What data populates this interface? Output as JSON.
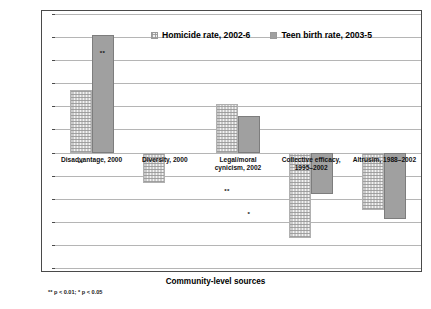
{
  "chart_data": {
    "type": "bar",
    "title": "",
    "xlabel": "Community-level sources",
    "ylabel": "Standardized coefficients",
    "ylim": [
      -0.5,
      0.6
    ],
    "ytick_values": [
      0.6,
      0.5,
      0.4,
      0.3,
      0.2,
      0.1,
      0.0,
      -0.1,
      -0.2,
      -0.3,
      -0.4,
      -0.5
    ],
    "ytick_labels": [
      "0.60",
      "0.50",
      "0.40",
      "0.30",
      "0.20",
      "0.10",
      "0.00",
      "-0.10",
      "-0.20",
      "-0.30",
      "-0.40",
      "-0.50"
    ],
    "grid": true,
    "legend_position": "top-center",
    "categories": [
      "Disadvantage, 2000",
      "Diversity, 2000",
      "Legal/moral\ncynicism, 2002",
      "Collective efficacy,\n1995–2002",
      "Altrusim, 1988–2002"
    ],
    "series": [
      {
        "name": "Homicide rate, 2002-6",
        "style": "dotted",
        "color": "#f2f2f2",
        "values": [
          0.27,
          -0.13,
          0.21,
          -0.37,
          -0.25
        ],
        "significance": [
          "**",
          "",
          "**",
          "**",
          "**"
        ]
      },
      {
        "name": "Teen birth rate, 2003-5",
        "style": "solid",
        "color": "#a0a0a0",
        "values": [
          0.51,
          null,
          0.16,
          -0.18,
          -0.29
        ],
        "significance": [
          "**",
          "",
          "*",
          "*",
          "**"
        ]
      }
    ],
    "footnote": "** p < 0.01; * p < 0.05"
  },
  "legend": {
    "items": [
      {
        "label": "Homicide rate, 2002-6"
      },
      {
        "label": "Teen birth rate, 2003-5"
      }
    ]
  },
  "axes": {
    "y_title": "Standardized coefficients",
    "x_title": "Community-level sources"
  },
  "footnote": "** p < 0.01; * p < 0.05"
}
